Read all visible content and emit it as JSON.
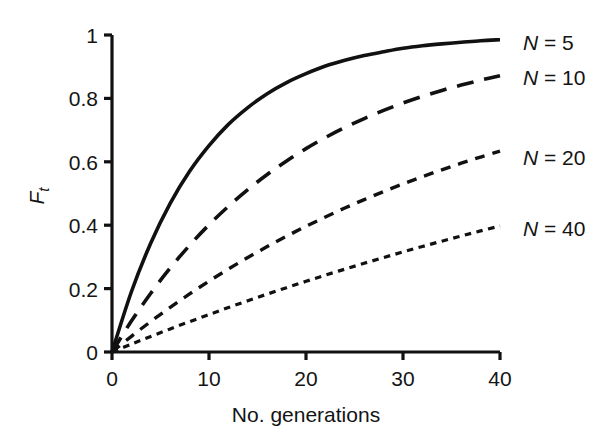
{
  "chart_data": {
    "type": "line",
    "title": "",
    "subtitle": "",
    "xlabel": "No. generations",
    "ylabel": "F_t",
    "ylabel_base": "F",
    "ylabel_sub": "t",
    "xlim": [
      0,
      40
    ],
    "ylim": [
      0,
      1
    ],
    "xticks": [
      0,
      10,
      20,
      30,
      40
    ],
    "xtick_labels": [
      "0",
      "10",
      "20",
      "30",
      "40"
    ],
    "yticks": [
      0,
      0.2,
      0.4,
      0.6,
      0.8,
      1
    ],
    "ytick_labels": [
      "0",
      "0.2",
      "0.4",
      "0.6",
      "0.8",
      "1"
    ],
    "grid": false,
    "legend_position": "right-inline",
    "axis_color": "#111111",
    "line_color": "#111111",
    "background": "#ffffff",
    "formula": "F_t = 1 - (1 - 1/(2N))^t",
    "series": [
      {
        "name": "N = 5",
        "label_prefix": "N",
        "label_eq": "=",
        "label_value": "5",
        "N": 5,
        "dash": "solid",
        "dasharray": "",
        "linewidth": 3.6,
        "label_x": 523,
        "label_y": 42,
        "x": [
          0,
          2,
          4,
          6,
          8,
          10,
          12,
          14,
          16,
          18,
          20,
          22,
          24,
          26,
          28,
          30,
          32,
          34,
          36,
          38,
          40
        ],
        "y": [
          0,
          0.19,
          0.344,
          0.469,
          0.57,
          0.651,
          0.718,
          0.771,
          0.815,
          0.85,
          0.878,
          0.902,
          0.92,
          0.935,
          0.947,
          0.958,
          0.966,
          0.972,
          0.977,
          0.982,
          0.985
        ]
      },
      {
        "name": "N = 10",
        "label_prefix": "N",
        "label_eq": "=",
        "label_value": "10",
        "N": 10,
        "dash": "long-dash",
        "dasharray": "17 11",
        "linewidth": 3.6,
        "label_x": 523,
        "label_y": 77,
        "x": [
          0,
          2,
          4,
          6,
          8,
          10,
          12,
          14,
          16,
          18,
          20,
          22,
          24,
          26,
          28,
          30,
          32,
          34,
          36,
          38,
          40
        ],
        "y": [
          0,
          0.0975,
          0.1855,
          0.2649,
          0.3366,
          0.4013,
          0.4596,
          0.5123,
          0.5599,
          0.6028,
          0.6415,
          0.6765,
          0.708,
          0.7365,
          0.7621,
          0.7854,
          0.8063,
          0.8251,
          0.8421,
          0.8575,
          0.8714
        ]
      },
      {
        "name": "N = 20",
        "label_prefix": "N",
        "label_eq": "=",
        "label_value": "20",
        "N": 20,
        "dash": "medium-dash",
        "dasharray": "10 8",
        "linewidth": 3.4,
        "label_x": 523,
        "label_y": 157,
        "x": [
          0,
          2,
          4,
          6,
          8,
          10,
          12,
          14,
          16,
          18,
          20,
          22,
          24,
          26,
          28,
          30,
          32,
          34,
          36,
          38,
          40
        ],
        "y": [
          0,
          0.0494,
          0.0963,
          0.1409,
          0.1832,
          0.2235,
          0.2617,
          0.298,
          0.3325,
          0.3653,
          0.3964,
          0.426,
          0.4541,
          0.4808,
          0.5061,
          0.5302,
          0.5531,
          0.5748,
          0.5955,
          0.6151,
          0.6338
        ]
      },
      {
        "name": "N = 40",
        "label_prefix": "N",
        "label_eq": "=",
        "label_value": "40",
        "N": 40,
        "dash": "short-dash",
        "dasharray": "6.5 5.5",
        "linewidth": 3.2,
        "label_x": 523,
        "label_y": 228,
        "x": [
          0,
          2,
          4,
          6,
          8,
          10,
          12,
          14,
          16,
          18,
          20,
          22,
          24,
          26,
          28,
          30,
          32,
          34,
          36,
          38,
          40
        ],
        "y": [
          0,
          0.0248,
          0.0491,
          0.0727,
          0.0958,
          0.1183,
          0.1403,
          0.1617,
          0.1826,
          0.203,
          0.2229,
          0.2424,
          0.2613,
          0.2799,
          0.2979,
          0.3156,
          0.3328,
          0.3496,
          0.366,
          0.382,
          0.3976
        ]
      }
    ]
  },
  "plot_geometry": {
    "left": 112,
    "right": 500,
    "top": 35,
    "bottom": 352,
    "tick_length": 8
  }
}
